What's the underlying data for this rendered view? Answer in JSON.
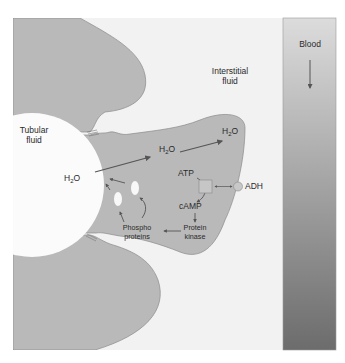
{
  "diagram": {
    "regions": {
      "tubular_fluid": [
        "Tubular",
        "fluid"
      ],
      "interstitial_fluid": [
        "Interstitial",
        "fluid"
      ],
      "blood": "Blood"
    },
    "molecules": {
      "water_lumen": {
        "base": "H",
        "sub": "2",
        "tail": "O"
      },
      "water_cell": {
        "base": "H",
        "sub": "2",
        "tail": "O"
      },
      "water_interstitial": {
        "base": "H",
        "sub": "2",
        "tail": "O"
      },
      "atp": "ATP",
      "camp": "cAMP",
      "protein_kinase": [
        "Protein",
        "kinase"
      ],
      "phosphoproteins": [
        "Phospho",
        "proteins"
      ],
      "adh": "ADH"
    },
    "colors": {
      "cell": "#b8b8b8",
      "cell_outline": "#8a8a8a",
      "interstitial": "#f2f2f2",
      "lumen": "#fbfbfb",
      "blood_top": "#d8d8d8",
      "blood_bottom": "#6f6f6f",
      "arrow": "#555555",
      "receptor": "#c4c4c4",
      "adh_dot": "#c8c8c8"
    }
  }
}
